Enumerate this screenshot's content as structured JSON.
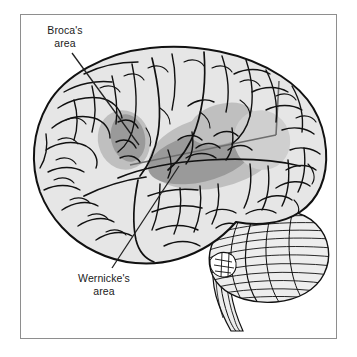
{
  "figure": {
    "type": "anatomical-illustration",
    "background_color": "#ffffff",
    "frame": {
      "border_color": "#8e8e8e",
      "fill_color": "#ffffff"
    }
  },
  "labels": {
    "brocas": {
      "line1": "Broca's",
      "line2": "area"
    },
    "wernickes": {
      "line1": "Wernicke's",
      "line2": "area"
    }
  },
  "regions": {
    "brocas_area": {
      "name": "Broca's area",
      "fill_color": "#9a9a9a"
    },
    "wernickes_area": {
      "name": "Wernicke's area",
      "fill_color": "#9a9a9a"
    },
    "secondary_shading": {
      "name": "adjacent cortical shading",
      "fill_color": "#b8b8b8"
    },
    "cerebrum": {
      "name": "cerebrum",
      "fill_color": "#e6e6e6"
    },
    "cerebellum": {
      "name": "cerebellum",
      "fill_color": "#ededed"
    },
    "brainstem": {
      "name": "brainstem",
      "fill_color": "#ededed"
    }
  },
  "colors": {
    "outline": "#111111",
    "sulci": "#111111",
    "leader_line": "#222222"
  }
}
